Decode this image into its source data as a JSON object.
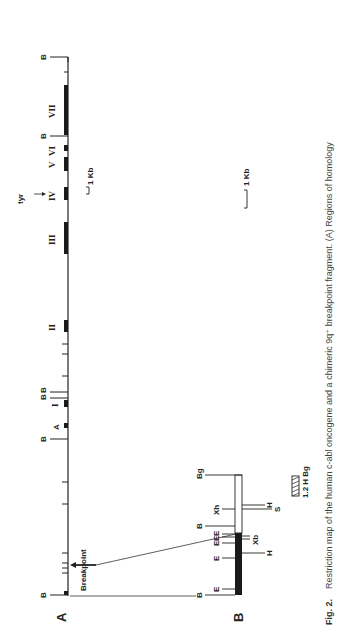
{
  "figure": {
    "orientation": "rotated 90° counter-clockwise",
    "panel_a_label": "A",
    "panel_b_label": "B",
    "panel_a": {
      "site_labels": [
        "B",
        "B",
        "B",
        "B",
        "B",
        "B"
      ],
      "exons": [
        "A",
        "I",
        "II",
        "III",
        "IV",
        "V",
        "VI",
        "VII"
      ],
      "exon_labels": {
        "A": "A",
        "I": "I",
        "II": "II",
        "III": "III",
        "IV": "IV",
        "V": "V",
        "VI": "VI",
        "VII": "VII"
      },
      "tyr_label": "tyr",
      "breakpoint_label": "Breakpoint",
      "scale_label": "1 Kb"
    },
    "panel_b": {
      "left_sites": [
        "B",
        "E",
        "E",
        "E",
        "E",
        "E",
        "B",
        "Xh",
        "Bg"
      ],
      "right_sites": [
        "H",
        "Xb",
        "S",
        "H"
      ],
      "labels": {
        "B1": "B",
        "E1": "E",
        "E2": "E",
        "E3": "E",
        "E4": "E",
        "E5": "E",
        "B2": "B",
        "Xh": "Xh",
        "Bg": "Bg",
        "H1": "H",
        "Xb": "Xb",
        "H2": "H",
        "S": "S"
      },
      "probe_label": "1.2 H Bg",
      "scale_label": "1 Kb"
    },
    "caption": {
      "fig_label": "Fig. 2.",
      "text": "Restriction map of the human c-abl oncogene and a chimeric 9q⁺ breakpoint fragment. (A) Regions of homology"
    }
  }
}
